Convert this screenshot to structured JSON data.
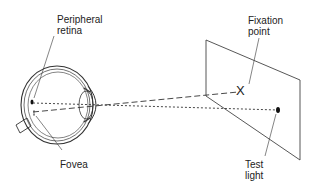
{
  "figure": {
    "labels": {
      "peripheral_retina_line1": "Peripheral",
      "peripheral_retina_line2": "retina",
      "fovea": "Fovea",
      "fixation_point_line1": "Fixation",
      "fixation_point_line2": "point",
      "test_light_line1": "Test",
      "test_light_line2": "light"
    },
    "markers": {
      "fixation_mark": "X"
    },
    "colors": {
      "stroke": "#333333",
      "background": "#ffffff"
    }
  }
}
